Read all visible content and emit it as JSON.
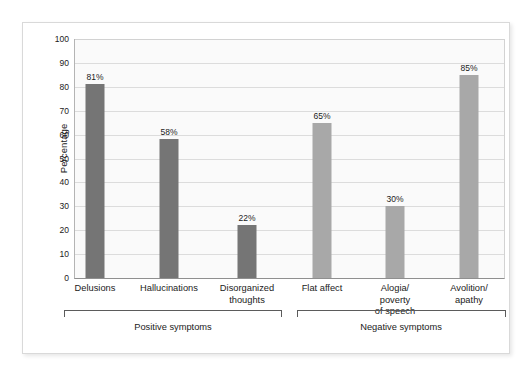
{
  "chart_data": {
    "type": "bar",
    "title": "",
    "subtitle": "",
    "xlabel": "",
    "ylabel": "Percentage",
    "ylim": [
      0,
      100
    ],
    "ytick_step": 10,
    "yticks": [
      "100",
      "90",
      "80",
      "70",
      "60",
      "50",
      "40",
      "30",
      "20",
      "10",
      "0"
    ],
    "grid": true,
    "legend": "none",
    "value_label_suffix": "%",
    "categories": [
      "Delusions",
      "Hallucinations",
      "Disorganized thoughts",
      "Flat affect",
      "Alogia/ poverty of speech",
      "Avolition/ apathy"
    ],
    "values": [
      81,
      58,
      22,
      65,
      30,
      85
    ],
    "value_labels": [
      "81%",
      "58%",
      "22%",
      "65%",
      "30%",
      "85%"
    ],
    "bars": [
      {
        "label_line1": "Delusions",
        "label_line2": "",
        "label_line3": "",
        "value": 81,
        "value_label": "81%",
        "group": "positive",
        "color": "#757575"
      },
      {
        "label_line1": "Hallucinations",
        "label_line2": "",
        "label_line3": "",
        "value": 58,
        "value_label": "58%",
        "group": "positive",
        "color": "#757575"
      },
      {
        "label_line1": "Disorganized",
        "label_line2": "thoughts",
        "label_line3": "",
        "value": 22,
        "value_label": "22%",
        "group": "positive",
        "color": "#757575"
      },
      {
        "label_line1": "Flat affect",
        "label_line2": "",
        "label_line3": "",
        "value": 65,
        "value_label": "65%",
        "group": "negative",
        "color": "#a8a8a8"
      },
      {
        "label_line1": "Alogia/",
        "label_line2": "poverty",
        "label_line3": "of speech",
        "value": 30,
        "value_label": "30%",
        "group": "negative",
        "color": "#a8a8a8"
      },
      {
        "label_line1": "Avolition/",
        "label_line2": "apathy",
        "label_line3": "",
        "value": 85,
        "value_label": "85%",
        "group": "negative",
        "color": "#a8a8a8"
      }
    ],
    "groups": [
      {
        "name": "positive",
        "label": "Positive symptoms",
        "color": "#757575"
      },
      {
        "name": "negative",
        "label": "Negative symptoms",
        "color": "#a8a8a8"
      }
    ],
    "colors": {
      "positive_bar": "#757575",
      "negative_bar": "#a8a8a8",
      "plot_background": "#fafafa",
      "gridline": "#dcdcdc",
      "axis": "#8f8f8f",
      "text": "#1b1b1b",
      "card_border": "#d9d9d9"
    }
  }
}
